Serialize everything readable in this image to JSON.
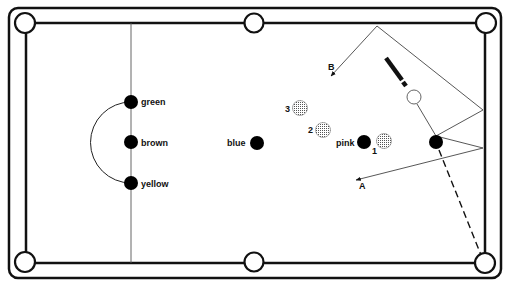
{
  "diagram": {
    "type": "snooker-table-shot-diagram",
    "colors": {
      "line": "#111111",
      "ball_solid": "#000000",
      "ball_object": "#cfcfcf",
      "background": "#ffffff"
    },
    "balls": {
      "green": "green",
      "brown": "brown",
      "yellow": "yellow",
      "blue": "blue",
      "pink": "pink",
      "red1": "1",
      "red2": "2",
      "red3": "3"
    },
    "paths": {
      "a": "A",
      "b": "B"
    }
  }
}
